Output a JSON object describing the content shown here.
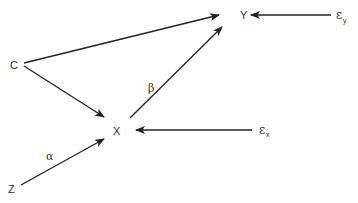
{
  "diagram": {
    "type": "causal-path-diagram",
    "nodes": [
      {
        "id": "C",
        "label": "C"
      },
      {
        "id": "Y",
        "label": "Y"
      },
      {
        "id": "X",
        "label": "X"
      },
      {
        "id": "Z",
        "label": "Z"
      }
    ],
    "error_terms": [
      {
        "id": "eps_y",
        "symbol": "ε",
        "subscript": "y",
        "target": "Y"
      },
      {
        "id": "eps_x",
        "symbol": "ε",
        "subscript": "x",
        "target": "X"
      }
    ],
    "edges": [
      {
        "from": "C",
        "to": "Y",
        "label": ""
      },
      {
        "from": "C",
        "to": "X",
        "label": ""
      },
      {
        "from": "X",
        "to": "Y",
        "label": "β"
      },
      {
        "from": "Z",
        "to": "X",
        "label": "α"
      },
      {
        "from": "eps_y",
        "to": "Y",
        "label": ""
      },
      {
        "from": "eps_x",
        "to": "X",
        "label": ""
      }
    ],
    "edge_labels": {
      "beta": "β",
      "alpha": "α"
    },
    "colors": {
      "line": "#222222",
      "text": "#333333",
      "background": "#ffffff"
    }
  }
}
